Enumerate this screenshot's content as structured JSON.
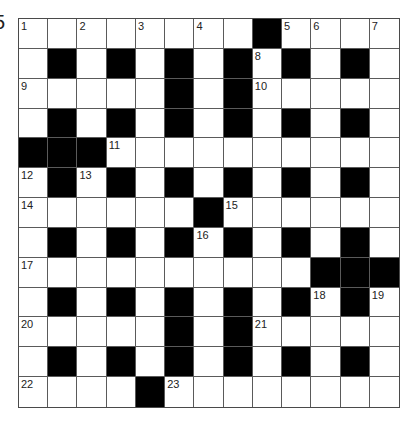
{
  "puzzle": {
    "number_label": "5"
  },
  "grid": {
    "rows": 13,
    "cols": 13,
    "layout": [
      "........#....",
      ".#.#.#.#.#.#.",
      ".....#.#.....",
      ".#.#.#.#.#.#.",
      "###..........",
      ".#.#.#.#.#.#.",
      "......#......",
      ".#.#.#.#.#.#.",
      "..........###",
      ".#.#.#.#.#.#.",
      ".....#.#.....",
      ".#.#.#.#.#.#.",
      "....#........"
    ],
    "numbers": [
      {
        "row": 0,
        "col": 0,
        "n": "1"
      },
      {
        "row": 0,
        "col": 2,
        "n": "2"
      },
      {
        "row": 0,
        "col": 4,
        "n": "3"
      },
      {
        "row": 0,
        "col": 6,
        "n": "4"
      },
      {
        "row": 0,
        "col": 9,
        "n": "5"
      },
      {
        "row": 0,
        "col": 10,
        "n": "6"
      },
      {
        "row": 0,
        "col": 12,
        "n": "7"
      },
      {
        "row": 1,
        "col": 8,
        "n": "8"
      },
      {
        "row": 2,
        "col": 0,
        "n": "9"
      },
      {
        "row": 2,
        "col": 8,
        "n": "10"
      },
      {
        "row": 4,
        "col": 3,
        "n": "11"
      },
      {
        "row": 5,
        "col": 0,
        "n": "12"
      },
      {
        "row": 5,
        "col": 2,
        "n": "13"
      },
      {
        "row": 6,
        "col": 0,
        "n": "14"
      },
      {
        "row": 6,
        "col": 7,
        "n": "15"
      },
      {
        "row": 7,
        "col": 6,
        "n": "16"
      },
      {
        "row": 8,
        "col": 0,
        "n": "17"
      },
      {
        "row": 9,
        "col": 10,
        "n": "18"
      },
      {
        "row": 9,
        "col": 12,
        "n": "19"
      },
      {
        "row": 10,
        "col": 0,
        "n": "20"
      },
      {
        "row": 10,
        "col": 8,
        "n": "21"
      },
      {
        "row": 12,
        "col": 0,
        "n": "22"
      },
      {
        "row": 12,
        "col": 5,
        "n": "23"
      }
    ]
  },
  "colors": {
    "block": "#000000",
    "cell": "#ffffff",
    "line": "#5a5a5a",
    "number": "#222222"
  }
}
